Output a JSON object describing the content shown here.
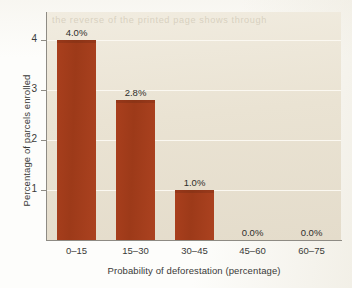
{
  "chart_data": {
    "type": "bar",
    "title": "",
    "subtitle": "",
    "xlabel": "Probability of deforestation (percentage)",
    "ylabel": "Percentage of parcels enrolled",
    "categories": [
      "0–15",
      "15–30",
      "30–45",
      "45–60",
      "60–75"
    ],
    "values": [
      4.0,
      2.8,
      1.0,
      0.0,
      0.0
    ],
    "data_labels": [
      "4.0%",
      "2.8%",
      "1.0%",
      "0.0%",
      "0.0%"
    ],
    "ylim": [
      0,
      4.56
    ],
    "ytick_values": [
      1,
      2,
      3,
      4
    ],
    "ytick_labels": [
      "1",
      "2",
      "3",
      "4"
    ],
    "grid": "horizontal",
    "legend": "none",
    "bar_color": "#a93f1d",
    "plot_background": "#ece5d7",
    "gridline_color": "#fbf8f1",
    "axis_color": "#8e8b84",
    "text_color": "#3a3a38"
  },
  "artifacts": {
    "ghost_text": "the reverse of the printed page shows through"
  }
}
